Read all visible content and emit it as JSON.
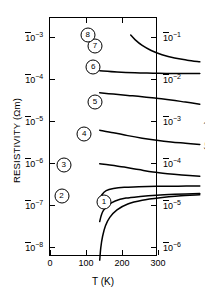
{
  "chart_data": {
    "type": "line",
    "title": "",
    "xlabel": "T (K)",
    "ylabel": "RESISTIVITY (Ωm)",
    "ylabel_right": "ρ (Ω cm)",
    "xlim": [
      0,
      300
    ],
    "xticks": [
      0,
      100,
      200,
      300
    ],
    "xticklabels": [
      "0",
      "100",
      "200",
      "300"
    ],
    "ylim_log10": [
      -8.25,
      -2.55
    ],
    "yticks_left_log10": [
      -3,
      -4,
      -5,
      -6,
      -7,
      -8
    ],
    "yticklabels_left": [
      {
        "mantissa": "10",
        "exponent": "-3"
      },
      {
        "mantissa": "10",
        "exponent": "-4"
      },
      {
        "mantissa": "10",
        "exponent": "-5"
      },
      {
        "mantissa": "10",
        "exponent": "-6"
      },
      {
        "mantissa": "10",
        "exponent": "-7"
      },
      {
        "mantissa": "10",
        "exponent": "-8"
      }
    ],
    "yticks_right_log10": [
      -3,
      -4,
      -5,
      -6,
      -7,
      -8
    ],
    "yticklabels_right": [
      {
        "mantissa": "10",
        "exponent": "-1"
      },
      {
        "mantissa": "10",
        "exponent": "-2"
      },
      {
        "mantissa": "10",
        "exponent": "-3"
      },
      {
        "mantissa": "10",
        "exponent": "-4"
      },
      {
        "mantissa": "10",
        "exponent": "-5"
      },
      {
        "mantissa": "10",
        "exponent": "-6"
      }
    ],
    "right_axis_note": "right axis is left axis value x100 (Ω cm)",
    "grid": false,
    "legend": "inline circled numbers on curves",
    "series": [
      {
        "name": "1",
        "label": "①",
        "label_xy": [
          150,
          -6.95
        ],
        "points": [
          [
            2,
            -7.92
          ],
          [
            5,
            -7.62
          ],
          [
            10,
            -7.35
          ],
          [
            18,
            -7.1
          ],
          [
            30,
            -6.9
          ],
          [
            50,
            -6.72
          ],
          [
            80,
            -6.58
          ],
          [
            120,
            -6.49
          ],
          [
            170,
            -6.43
          ],
          [
            220,
            -6.39
          ],
          [
            280,
            -6.36
          ]
        ]
      },
      {
        "name": "2",
        "label": "②",
        "label_xy": [
          32,
          -6.8
        ],
        "points": [
          [
            2,
            -7.0
          ],
          [
            6,
            -6.86
          ],
          [
            12,
            -6.74
          ],
          [
            25,
            -6.61
          ],
          [
            45,
            -6.51
          ],
          [
            75,
            -6.44
          ],
          [
            115,
            -6.4
          ],
          [
            160,
            -6.37
          ],
          [
            210,
            -6.35
          ],
          [
            280,
            -6.33
          ]
        ]
      },
      {
        "name": "3",
        "label": "③",
        "label_xy": [
          38,
          -6.05
        ],
        "points": [
          [
            2,
            -6.48
          ],
          [
            8,
            -6.36
          ],
          [
            20,
            -6.26
          ],
          [
            40,
            -6.21
          ],
          [
            70,
            -6.18
          ],
          [
            110,
            -6.17
          ],
          [
            160,
            -6.16
          ],
          [
            220,
            -6.155
          ],
          [
            280,
            -6.15
          ]
        ]
      },
      {
        "name": "4",
        "label": "④",
        "label_xy": [
          95,
          -5.32
        ],
        "points": [
          [
            2,
            -5.62
          ],
          [
            30,
            -5.65
          ],
          [
            70,
            -5.7
          ],
          [
            110,
            -5.76
          ],
          [
            150,
            -5.82
          ],
          [
            190,
            -5.86
          ],
          [
            230,
            -5.89
          ],
          [
            280,
            -5.92
          ]
        ]
      },
      {
        "name": "5",
        "label": "⑤",
        "label_xy": [
          125,
          -4.55
        ],
        "points": [
          [
            2,
            -4.82
          ],
          [
            40,
            -4.88
          ],
          [
            80,
            -4.95
          ],
          [
            120,
            -5.01
          ],
          [
            160,
            -5.06
          ],
          [
            200,
            -5.1
          ],
          [
            240,
            -5.13
          ],
          [
            280,
            -5.16
          ]
        ]
      },
      {
        "name": "6",
        "label": "⑥",
        "label_xy": [
          120,
          -3.72
        ],
        "points": [
          [
            2,
            -3.93
          ],
          [
            40,
            -3.96
          ],
          [
            80,
            -3.99
          ],
          [
            120,
            -4.02
          ],
          [
            160,
            -4.06
          ],
          [
            200,
            -4.1
          ],
          [
            240,
            -4.15
          ],
          [
            280,
            -4.2
          ]
        ]
      },
      {
        "name": "7",
        "label": "⑦",
        "label_xy": [
          125,
          -3.22
        ],
        "points": [
          [
            2,
            -3.4
          ],
          [
            50,
            -3.43
          ],
          [
            100,
            -3.45
          ],
          [
            150,
            -3.46
          ],
          [
            200,
            -3.47
          ],
          [
            250,
            -3.47
          ],
          [
            280,
            -3.47
          ]
        ]
      },
      {
        "name": "8",
        "label": "⑧",
        "label_xy": [
          105,
          -2.95
        ],
        "points": [
          [
            88,
            -2.55
          ],
          [
            100,
            -2.66
          ],
          [
            120,
            -2.8
          ],
          [
            145,
            -2.92
          ],
          [
            175,
            -3.02
          ],
          [
            210,
            -3.1
          ],
          [
            245,
            -3.15
          ],
          [
            280,
            -3.19
          ]
        ]
      }
    ]
  }
}
